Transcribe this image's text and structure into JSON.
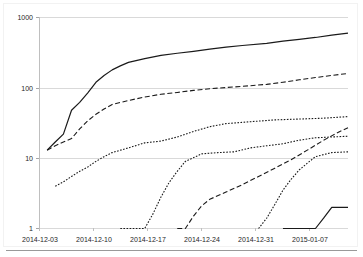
{
  "chart_data": {
    "type": "line",
    "title": "",
    "xlabel": "",
    "ylabel": "",
    "yscale": "log",
    "ylim": [
      1,
      1000
    ],
    "ytick_labels": [
      "1000",
      "100",
      "10",
      "1"
    ],
    "ytick_values": [
      1000,
      100,
      10,
      1
    ],
    "xtick_labels": [
      "2014-12-03",
      "2014-12-10",
      "2014-12-17",
      "2014-12-24",
      "2014-12-31",
      "2015-01-07"
    ],
    "xlim": [
      "2014-12-03",
      "2015-01-10"
    ],
    "grid": "horizontal",
    "legend": "none",
    "line_color": "#000000",
    "grid_color": "#d9d9d9",
    "series": [
      {
        "name": "series-1-solid",
        "style": "solid",
        "x": [
          "2014-12-04",
          "2014-12-05",
          "2014-12-06",
          "2014-12-07",
          "2014-12-08",
          "2014-12-09",
          "2014-12-10",
          "2014-12-11",
          "2014-12-12",
          "2014-12-13",
          "2014-12-14",
          "2014-12-16",
          "2014-12-18",
          "2014-12-20",
          "2014-12-22",
          "2014-12-24",
          "2014-12-26",
          "2014-12-28",
          "2014-12-31",
          "2015-01-02",
          "2015-01-04",
          "2015-01-06",
          "2015-01-08",
          "2015-01-10"
        ],
        "values": [
          13,
          17,
          22,
          48,
          62,
          85,
          120,
          150,
          180,
          205,
          230,
          260,
          290,
          310,
          330,
          355,
          380,
          400,
          430,
          460,
          490,
          520,
          560,
          600
        ]
      },
      {
        "name": "series-2-dashed",
        "style": "dashed",
        "x": [
          "2014-12-04",
          "2014-12-05",
          "2014-12-06",
          "2014-12-07",
          "2014-12-08",
          "2014-12-09",
          "2014-12-10",
          "2014-12-11",
          "2014-12-12",
          "2014-12-14",
          "2014-12-16",
          "2014-12-18",
          "2014-12-20",
          "2014-12-22",
          "2014-12-24",
          "2014-12-26",
          "2014-12-28",
          "2014-12-31",
          "2015-01-02",
          "2015-01-04",
          "2015-01-06",
          "2015-01-08",
          "2015-01-10"
        ],
        "values": [
          13,
          15,
          17,
          19,
          26,
          34,
          42,
          50,
          58,
          66,
          74,
          81,
          86,
          92,
          97,
          101,
          105,
          112,
          120,
          130,
          140,
          150,
          160
        ]
      },
      {
        "name": "series-3-dotted",
        "style": "dotted",
        "x": [
          "2014-12-05",
          "2014-12-06",
          "2014-12-07",
          "2014-12-08",
          "2014-12-09",
          "2014-12-10",
          "2014-12-11",
          "2014-12-12",
          "2014-12-14",
          "2014-12-16",
          "2014-12-17",
          "2014-12-18",
          "2014-12-20",
          "2014-12-22",
          "2014-12-24",
          "2014-12-26",
          "2014-12-29",
          "2015-01-01",
          "2015-01-04",
          "2015-01-07",
          "2015-01-10"
        ],
        "values": [
          4,
          4.6,
          5.5,
          6.5,
          7.5,
          9,
          10.5,
          12,
          14,
          16.5,
          17,
          17.5,
          20,
          24,
          28,
          31,
          33,
          35,
          36,
          37,
          39
        ]
      },
      {
        "name": "series-4-dotted-late",
        "style": "dotted",
        "x": [
          "2014-12-13",
          "2014-12-14",
          "2014-12-15",
          "2014-12-16",
          "2014-12-17",
          "2014-12-18",
          "2014-12-19",
          "2014-12-20",
          "2014-12-21",
          "2014-12-23",
          "2014-12-25",
          "2014-12-27",
          "2014-12-29",
          "2014-12-31",
          "2015-01-02",
          "2015-01-04",
          "2015-01-06",
          "2015-01-08",
          "2015-01-10"
        ],
        "values": [
          1,
          1,
          1,
          1,
          1.6,
          2.8,
          4.5,
          6.5,
          9,
          11.5,
          12,
          12.3,
          14,
          15,
          16,
          18,
          19.5,
          20,
          20.5
        ]
      },
      {
        "name": "series-5-dashed-late",
        "style": "dashed",
        "x": [
          "2014-12-20",
          "2014-12-21",
          "2014-12-22",
          "2014-12-23",
          "2014-12-24",
          "2014-12-26",
          "2014-12-28",
          "2014-12-30",
          "2015-01-01",
          "2015-01-03",
          "2015-01-05",
          "2015-01-07",
          "2015-01-09",
          "2015-01-10"
        ],
        "values": [
          1,
          1,
          1.5,
          2.1,
          2.6,
          3.3,
          4.2,
          5.5,
          7.2,
          9.5,
          13,
          18,
          24,
          27
        ]
      },
      {
        "name": "series-6-dotted-newyear",
        "style": "dotted",
        "x": [
          "2014-12-30",
          "2014-12-31",
          "2015-01-01",
          "2015-01-02",
          "2015-01-03",
          "2015-01-04",
          "2015-01-05",
          "2015-01-06",
          "2015-01-08",
          "2015-01-10"
        ],
        "values": [
          1,
          1.4,
          2.2,
          3.5,
          5,
          6.8,
          8.5,
          10.5,
          12,
          12.3
        ]
      },
      {
        "name": "series-7-solid-last",
        "style": "solid",
        "x": [
          "2015-01-02",
          "2015-01-04",
          "2015-01-05",
          "2015-01-06",
          "2015-01-07",
          "2015-01-08",
          "2015-01-10"
        ],
        "values": [
          1,
          1,
          1,
          1,
          1.4,
          2,
          2
        ]
      }
    ]
  },
  "axes": {
    "y_ticks": [
      {
        "label": "1000",
        "value": 1000
      },
      {
        "label": "100",
        "value": 100
      },
      {
        "label": "10",
        "value": 10
      },
      {
        "label": "1",
        "value": 1
      }
    ],
    "x_ticks": [
      {
        "label": "2014-12-03"
      },
      {
        "label": "2014-12-10"
      },
      {
        "label": "2014-12-17"
      },
      {
        "label": "2014-12-24"
      },
      {
        "label": "2014-12-31"
      },
      {
        "label": "2015-01-07"
      }
    ]
  }
}
